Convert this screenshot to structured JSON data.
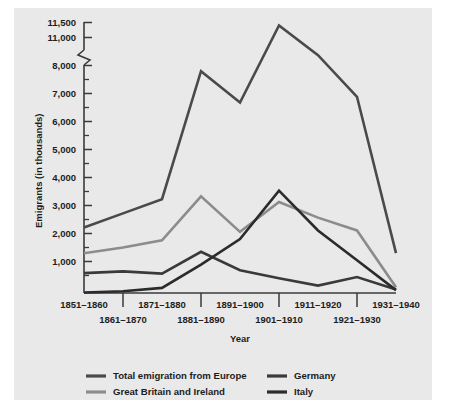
{
  "figure": {
    "background_color": "#e9e9e9",
    "page_background": "#ffffff"
  },
  "chart_data": {
    "type": "line",
    "title": "",
    "xlabel": "Year",
    "ylabel": "Emigrants (in thousands)",
    "categories": [
      "1851–1860",
      "1861–1870",
      "1871–1880",
      "1881–1890",
      "1891–1900",
      "1901–1910",
      "1911–1920",
      "1921–1930",
      "1931–1940"
    ],
    "yticks": [
      0,
      1000,
      2000,
      3000,
      4000,
      5000,
      6000,
      7000,
      8000,
      11000,
      11500
    ],
    "ytick_labels": [
      "",
      "1,000",
      "2,000",
      "3,000",
      "4,000",
      "5,000",
      "6,000",
      "7,000",
      "8,000",
      "11,000",
      "11,500"
    ],
    "ylim": [
      0,
      11500
    ],
    "axis_break": {
      "present": true,
      "between": [
        8000,
        11000
      ],
      "style": "zigzag"
    },
    "grid": false,
    "legend_position": "bottom",
    "series": [
      {
        "name": "Total emigration from Europe",
        "color": "#4a4a4a",
        "values": [
          2300,
          2800,
          3300,
          7800,
          6700,
          11400,
          9100,
          6900,
          1400
        ]
      },
      {
        "name": "Great Britain and Ireland",
        "color": "#8c8c8c",
        "values": [
          1400,
          1600,
          1850,
          3400,
          2150,
          3200,
          2650,
          2200,
          200
        ]
      },
      {
        "name": "Germany",
        "color": "#3a3a3a",
        "values": [
          700,
          760,
          680,
          1450,
          800,
          520,
          260,
          560,
          120
        ]
      },
      {
        "name": "Italy",
        "color": "#2b2b2b",
        "values": [
          20,
          60,
          180,
          1000,
          1900,
          3600,
          2200,
          1150,
          100
        ]
      }
    ]
  },
  "legend": {
    "items": [
      {
        "label": "Total emigration from Europe",
        "color": "#4a4a4a"
      },
      {
        "label": "Great Britain and Ireland",
        "color": "#8c8c8c"
      },
      {
        "label": "Germany",
        "color": "#3a3a3a"
      },
      {
        "label": "Italy",
        "color": "#2b2b2b"
      }
    ]
  },
  "axes": {
    "y_title": "Emigrants (in thousands)",
    "x_title": "Year",
    "y_labels": [
      "11,500",
      "11,000",
      "8,000",
      "7,000",
      "6,000",
      "5,000",
      "4,000",
      "3,000",
      "2,000",
      "1,000"
    ],
    "x_labels_top": [
      "1851–1860",
      "1871–1880",
      "1891–1900",
      "1911–1920",
      "1931–1940"
    ],
    "x_labels_bottom": [
      "1861–1870",
      "1881–1890",
      "1901–1910",
      "1921–1930"
    ]
  }
}
